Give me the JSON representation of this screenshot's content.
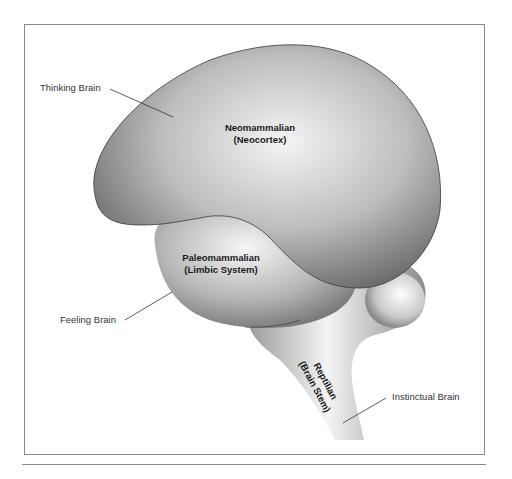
{
  "diagram": {
    "regions": [
      {
        "id": "neocortex",
        "name": "Neomammalian",
        "subname": "(Neocortex)",
        "callout": "Thinking Brain"
      },
      {
        "id": "limbic",
        "name": "Paleomammalian",
        "subname": "(Limbic System)",
        "callout": "Feeling Brain"
      },
      {
        "id": "brainstem",
        "name": "Reptilian",
        "subname": "(Brain Stem)",
        "callout": "Instinctual Brain"
      }
    ],
    "colors": {
      "shape_dark": "#6e6e6e",
      "shape_light": "#f2f2f2",
      "outline": "#3a3a3a",
      "frame": "#8a8a8a",
      "label_text": "#333333"
    }
  }
}
